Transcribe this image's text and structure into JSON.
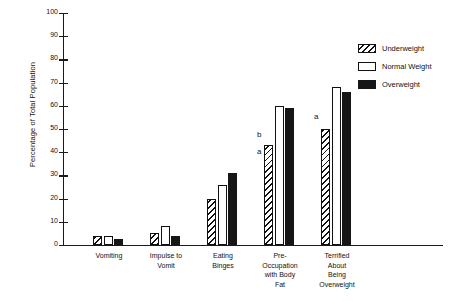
{
  "chart_data": {
    "type": "bar",
    "title": "",
    "xlabel": "",
    "ylabel": "Percentage of Total Population",
    "ylim": [
      0,
      100
    ],
    "ytick_step": 10,
    "yticks": [
      100,
      90,
      80,
      70,
      60,
      50,
      40,
      30,
      20,
      10,
      0
    ],
    "grid": false,
    "legend_position": "top-right",
    "categories": [
      "Vomiting",
      "Impulse to\nVomit",
      "Eating\nBinges",
      "Pre-\nOccupation\nwith Body\nFat",
      "Terrified\nAbout\nBeing\nOverweight"
    ],
    "series": [
      {
        "name": "Underweight",
        "fill": "diagonal-hatch",
        "values": [
          4,
          5,
          20,
          43,
          50
        ]
      },
      {
        "name": "Normal Weight",
        "fill": "white",
        "values": [
          4,
          8,
          26,
          60,
          68
        ]
      },
      {
        "name": "Overweight",
        "fill": "solid-black",
        "values": [
          2.5,
          4,
          31,
          59,
          66
        ]
      }
    ],
    "annotations": [
      {
        "text": "b",
        "category_index": 3,
        "series_index": 0,
        "value": 49
      },
      {
        "text": "a",
        "category_index": 3,
        "series_index": 0,
        "value": 42
      },
      {
        "text": "a",
        "category_index": 4,
        "series_index": 0,
        "value": 57
      }
    ]
  },
  "legend": {
    "items": [
      {
        "label": "Underweight"
      },
      {
        "label": "Normal Weight"
      },
      {
        "label": "Overweight"
      }
    ]
  },
  "axis": {
    "y_title": "Percentage of Total Population"
  },
  "colors": {
    "ink": "#111111",
    "fill_black": "#161616",
    "background": "#ffffff"
  }
}
